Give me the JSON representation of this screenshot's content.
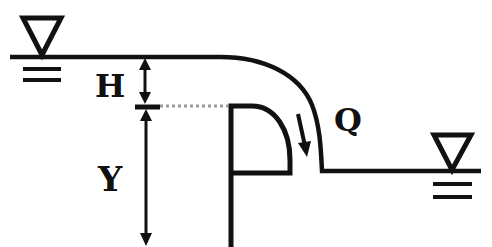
{
  "diagram": {
    "type": "sharp-crested weir flow schematic",
    "labels": {
      "head": "H",
      "weir_height": "Y",
      "discharge": "Q"
    },
    "symbols": {
      "upstream_water_surface": "water-surface-triangle",
      "downstream_water_surface": "water-surface-triangle"
    },
    "colors": {
      "stroke": "#111111",
      "dotted_reference": "#9a9a9a",
      "background": "#ffffff"
    }
  }
}
